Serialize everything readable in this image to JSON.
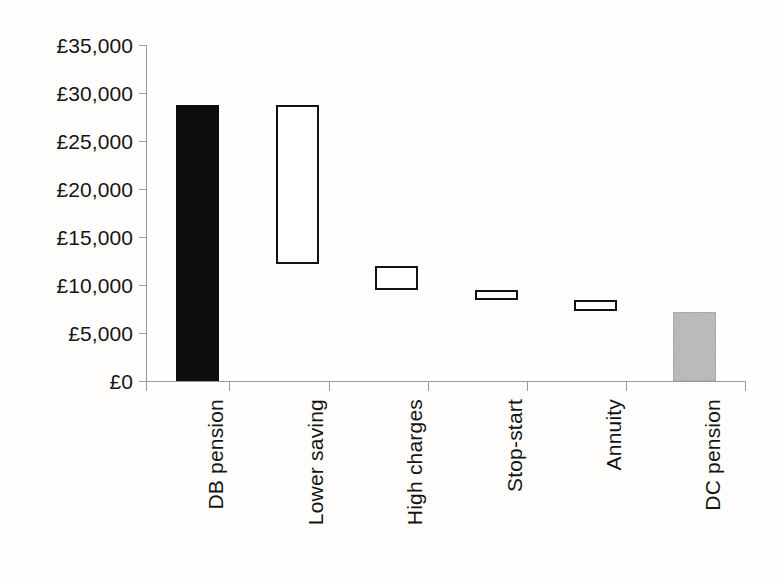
{
  "chart_data": {
    "type": "bar",
    "subtype": "waterfall",
    "title": "",
    "subtitle": "",
    "xlabel": "",
    "ylabel": "",
    "currency": "GBP",
    "currency_symbol": "£",
    "ylim": [
      0,
      35000
    ],
    "ytick_interval": 5000,
    "grid": false,
    "legend": false,
    "categories": [
      "DB pension",
      "Lower saving",
      "High charges",
      "Stop-start",
      "Annuity",
      "DC pension"
    ],
    "ytick_labels": [
      "£35,000",
      "£30,000",
      "£25,000",
      "£20,000",
      "£15,000",
      "£10,000",
      "£5,000",
      "£0"
    ],
    "ytick_values": [
      35000,
      30000,
      25000,
      20000,
      15000,
      10000,
      5000,
      0
    ],
    "bars": [
      {
        "label": "DB pension",
        "base": 0,
        "top": 28800,
        "value": 28800,
        "style": "solid-dark"
      },
      {
        "label": "Lower saving",
        "base": 12200,
        "top": 28800,
        "value": -16600,
        "style": "outline"
      },
      {
        "label": "High charges",
        "base": 9500,
        "top": 12000,
        "value": -2500,
        "style": "outline"
      },
      {
        "label": "Stop-start",
        "base": 8400,
        "top": 9500,
        "value": -1100,
        "style": "outline"
      },
      {
        "label": "Annuity",
        "base": 7300,
        "top": 8400,
        "value": -1100,
        "style": "outline"
      },
      {
        "label": "DC pension",
        "base": 0,
        "top": 7200,
        "value": 7200,
        "style": "solid-grey"
      }
    ],
    "colors": {
      "solid_dark": "#0d0d0d",
      "outline_stroke": "#131313",
      "outline_fill": "#ffffff",
      "solid_grey": "#b3b3b3",
      "axis": "#9a9a9a",
      "text": "#151515",
      "background": "#ffffff"
    }
  },
  "geometry": {
    "plot_left": 146,
    "plot_right": 746,
    "plot_top": 45,
    "baseline_y": 381,
    "value_top": 35000,
    "bar_width": 43,
    "category_centers": [
      197,
      297,
      396,
      496,
      595,
      694
    ],
    "tick_x": [
      146,
      229,
      329,
      428,
      527,
      626,
      745
    ]
  }
}
